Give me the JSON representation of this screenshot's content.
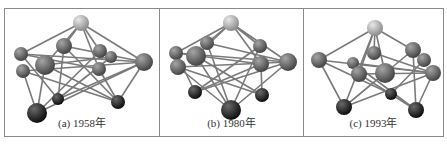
{
  "figure": {
    "panels": [
      {
        "id": "a",
        "caption": "(a) 1958年"
      },
      {
        "id": "b",
        "caption": "(b) 1980年"
      },
      {
        "id": "c",
        "caption": "(c) 1993年"
      }
    ],
    "colors": {
      "border": "#8a8a8a",
      "bond": "#7a7a7a",
      "atom_top": "#bdbdbd",
      "atom_mid": "#6e6e6e",
      "atom_dark": "#262626"
    }
  }
}
